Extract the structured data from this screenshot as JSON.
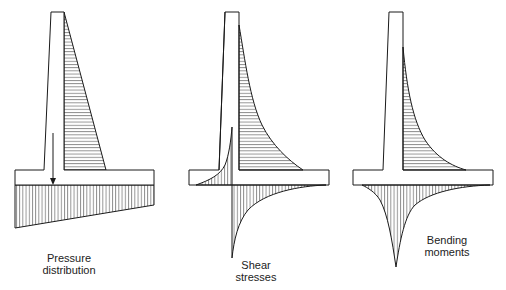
{
  "figure": {
    "panels": [
      {
        "id": "pressure",
        "label_lines": [
          "Pressure",
          "distribution"
        ],
        "description": "Retaining wall with triangular horizontal earth pressure on stem and trapezoidal soil pressure beneath base"
      },
      {
        "id": "shear",
        "label_lines": [
          "Shear",
          "stresses"
        ],
        "description": "Shear stress distribution in stem, toe and heel"
      },
      {
        "id": "bending",
        "label_lines": [
          "Bending",
          "moments"
        ],
        "description": "Bending moment distribution in stem and base slab"
      }
    ]
  },
  "colors": {
    "line": "#1a1a1a",
    "background": "#ffffff"
  }
}
